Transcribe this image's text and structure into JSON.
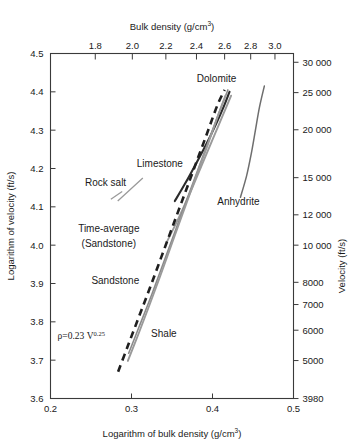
{
  "chart_data": {
    "type": "line",
    "title": "",
    "xlabel": "Logarithm of bulk density (g/cm3)",
    "ylabel": "Logarithm of velocity (ft/s)",
    "xlim": [
      0.2,
      0.5
    ],
    "ylim": [
      3.6,
      4.5
    ],
    "grid": false,
    "legend_position": "inline-annotations",
    "axes": {
      "bottom": {
        "title": "Logarithm of bulk density (g/cm",
        "title_sup": "3",
        "title_tail": ")",
        "ticks": [
          0.2,
          0.3,
          0.4,
          0.5
        ],
        "tick_labels": [
          "0.2",
          "0.3",
          "0.4",
          "0.5"
        ]
      },
      "left": {
        "title": "Logarithm of velocity (ft/s)",
        "ticks": [
          3.6,
          3.7,
          3.8,
          3.9,
          4.0,
          4.1,
          4.2,
          4.3,
          4.4,
          4.5
        ],
        "tick_labels": [
          "3.6",
          "3.7",
          "3.8",
          "3.9",
          "4.0",
          "4.1",
          "4.2",
          "4.3",
          "4.4",
          "4.5"
        ]
      },
      "top": {
        "title": "Bulk density (g/cm",
        "title_sup": "3",
        "title_tail": ")",
        "tick_values": [
          1.8,
          2.0,
          2.2,
          2.4,
          2.6,
          2.8,
          3.0
        ],
        "tick_labels": [
          "1.8",
          "2.0",
          "2.2",
          "2.4",
          "2.6",
          "2.8",
          "3.0"
        ],
        "scale": "log10-of-density"
      },
      "right": {
        "title": "Velocity (ft/s)",
        "tick_values": [
          3980,
          5000,
          6000,
          7000,
          8000,
          10000,
          12000,
          15000,
          20000,
          25000,
          30000
        ],
        "tick_labels": [
          "3980",
          "5000",
          "6000",
          "7000",
          "8000",
          "10 000",
          "12 000",
          "15 000",
          "20 000",
          "25 000",
          "30 000"
        ],
        "scale": "log10-of-velocity"
      }
    },
    "annotations": [
      {
        "name": "dolomite",
        "text": "Dolomite",
        "x": 0.405,
        "y": 4.425
      },
      {
        "name": "limestone",
        "text": "Limestone",
        "x": 0.335,
        "y": 4.205
      },
      {
        "name": "rock-salt",
        "text": "Rock salt",
        "x": 0.268,
        "y": 4.155
      },
      {
        "name": "anhydrite",
        "text": "Anhydrite",
        "x": 0.432,
        "y": 4.105
      },
      {
        "name": "time-average-sandstone-1",
        "text": "Time-average",
        "x": 0.272,
        "y": 4.035
      },
      {
        "name": "time-average-sandstone-2",
        "text": "(Sandstone)",
        "x": 0.272,
        "y": 3.995
      },
      {
        "name": "sandstone",
        "text": "Sandstone",
        "x": 0.28,
        "y": 3.9
      },
      {
        "name": "shale",
        "text": "Shale",
        "x": 0.34,
        "y": 3.76
      },
      {
        "name": "gardner-equation",
        "text": "ρ=0.23 V",
        "sup": "0.25",
        "x": 0.238,
        "y": 3.755
      }
    ],
    "series": [
      {
        "name": "Dolomite",
        "style": "solid-dark",
        "color": "#2b2b2b",
        "points": [
          [
            0.3535,
            4.115
          ],
          [
            0.366,
            4.16
          ],
          [
            0.379,
            4.21
          ],
          [
            0.392,
            4.262
          ],
          [
            0.4035,
            4.312
          ],
          [
            0.414,
            4.362
          ],
          [
            0.421,
            4.4
          ]
        ]
      },
      {
        "name": "Limestone",
        "style": "solid-gray",
        "color": "#9a9a9a",
        "points": [
          [
            0.344,
            4.01
          ],
          [
            0.358,
            4.07
          ],
          [
            0.372,
            4.135
          ],
          [
            0.386,
            4.205
          ],
          [
            0.399,
            4.27
          ],
          [
            0.411,
            4.33
          ],
          [
            0.423,
            4.39
          ]
        ]
      },
      {
        "name": "Anhydrite",
        "style": "solid-dark-thin",
        "color": "#2b2b2b",
        "points": [
          [
            0.4345,
            4.125
          ],
          [
            0.442,
            4.18
          ],
          [
            0.448,
            4.24
          ],
          [
            0.453,
            4.3
          ],
          [
            0.458,
            4.36
          ],
          [
            0.464,
            4.415
          ]
        ]
      },
      {
        "name": "Rock salt",
        "style": "solid-gray-short",
        "color": "#9a9a9a",
        "points": [
          [
            0.283,
            4.115
          ],
          [
            0.314,
            4.175
          ]
        ]
      },
      {
        "name": "Time-average (Sandstone)",
        "style": "solid-lightgray",
        "color": "#b0b0b0",
        "points": [
          [
            0.2965,
            3.718
          ],
          [
            0.309,
            3.785
          ],
          [
            0.323,
            3.86
          ],
          [
            0.337,
            3.94
          ],
          [
            0.351,
            4.02
          ],
          [
            0.365,
            4.1
          ],
          [
            0.379,
            4.18
          ],
          [
            0.393,
            4.26
          ],
          [
            0.407,
            4.34
          ],
          [
            0.419,
            4.405
          ]
        ]
      },
      {
        "name": "Gardner equation",
        "style": "dashed-black",
        "color": "#1f1f1f",
        "equation": "ρ=0.23 V^0.25",
        "points": [
          [
            0.2835,
            3.67
          ],
          [
            0.296,
            3.74
          ],
          [
            0.3095,
            3.815
          ],
          [
            0.323,
            3.89
          ],
          [
            0.337,
            3.97
          ],
          [
            0.351,
            4.05
          ],
          [
            0.365,
            4.13
          ],
          [
            0.379,
            4.21
          ],
          [
            0.393,
            4.29
          ],
          [
            0.406,
            4.365
          ],
          [
            0.415,
            4.405
          ]
        ]
      },
      {
        "name": "Shale",
        "style": "solid-gray",
        "color": "#9a9a9a",
        "points": [
          [
            0.2955,
            3.698
          ],
          [
            0.308,
            3.765
          ],
          [
            0.3215,
            3.84
          ],
          [
            0.3355,
            3.92
          ],
          [
            0.35,
            4.005
          ],
          [
            0.3645,
            4.09
          ],
          [
            0.379,
            4.175
          ],
          [
            0.393,
            4.255
          ],
          [
            0.4055,
            4.33
          ],
          [
            0.416,
            4.39
          ]
        ]
      }
    ]
  }
}
